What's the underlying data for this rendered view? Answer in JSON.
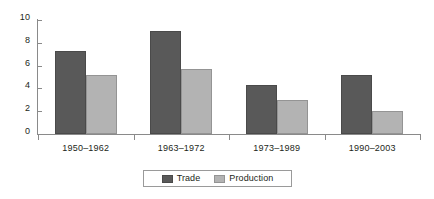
{
  "chart_data": {
    "type": "bar",
    "title": "",
    "subtitle": "",
    "xlabel": "",
    "ylabel": "",
    "categories": [
      "1950–1962",
      "1963–1972",
      "1973–1989",
      "1990–2003"
    ],
    "series": [
      {
        "name": "Trade",
        "color": "#595959",
        "values": [
          7.3,
          9.0,
          4.3,
          5.2
        ]
      },
      {
        "name": "Production",
        "color": "#b3b3b3",
        "values": [
          5.2,
          5.7,
          3.0,
          2.0
        ]
      }
    ],
    "ylim": [
      0,
      10
    ],
    "ytick_values": [
      0,
      2,
      4,
      6,
      8,
      10
    ],
    "ytick_labels": [
      "0",
      "2",
      "4",
      "6",
      "8",
      "10"
    ],
    "grid": false,
    "legend_position": "bottom-center",
    "legend_entries": [
      "Trade",
      "Production"
    ]
  }
}
